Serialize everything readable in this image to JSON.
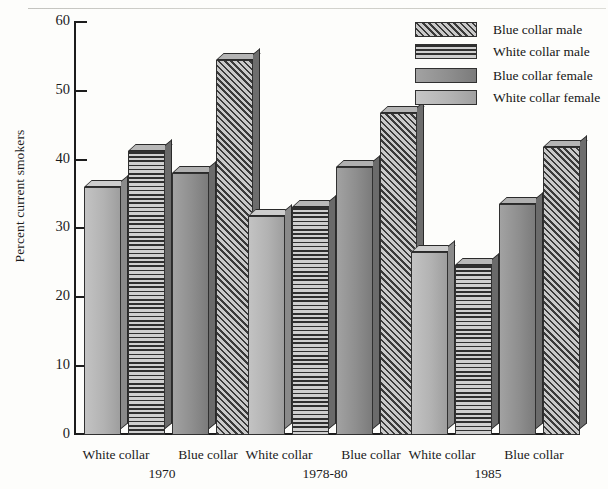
{
  "chart_data": {
    "type": "bar",
    "title": "",
    "xlabel": "",
    "ylabel": "Percent current smokers",
    "ylim": [
      0,
      60
    ],
    "ytick_labels": [
      "0",
      "10",
      "20",
      "30",
      "40",
      "50",
      "60"
    ],
    "ytick_values": [
      0,
      10,
      20,
      30,
      40,
      50,
      60
    ],
    "grid": false,
    "legend_position": "top-right",
    "groups": [
      {
        "period": "1970",
        "collars": [
          "White collar",
          "Blue collar"
        ]
      },
      {
        "period": "1978-80",
        "collars": [
          "White collar",
          "Blue collar"
        ]
      },
      {
        "period": "1985",
        "collars": [
          "White collar",
          "Blue collar"
        ]
      }
    ],
    "categories": [
      "1970",
      "1978-80",
      "1985"
    ],
    "series": [
      {
        "name": "Blue collar male",
        "pattern": "diagonal-hatch",
        "values": [
          54.3,
          46.7,
          41.8
        ]
      },
      {
        "name": "White collar male",
        "pattern": "horizontal-lines",
        "values": [
          41.2,
          33.0,
          24.7
        ]
      },
      {
        "name": "Blue collar female",
        "pattern": "solid-dark-gray",
        "values": [
          38.0,
          38.8,
          33.5
        ]
      },
      {
        "name": "White collar female",
        "pattern": "solid-light-gray",
        "values": [
          36.0,
          31.7,
          26.5
        ]
      }
    ],
    "bar_order_within_group": [
      "White collar female",
      "White collar male",
      "Blue collar female",
      "Blue collar male"
    ]
  },
  "legend": {
    "items": [
      {
        "label": "Blue collar male"
      },
      {
        "label": "White collar male"
      },
      {
        "label": "Blue collar female"
      },
      {
        "label": "White collar female"
      }
    ]
  },
  "axis": {
    "y_title": "Percent current smokers",
    "y_ticks": [
      "60",
      "50",
      "40",
      "30",
      "20",
      "10",
      "0"
    ]
  },
  "x_labels": {
    "g1_white": "White collar",
    "g1_blue": "Blue collar",
    "g1_period": "1970",
    "g2_white": "White collar",
    "g2_blue": "Blue collar",
    "g2_period": "1978-80",
    "g3_white": "White collar",
    "g3_blue": "Blue collar",
    "g3_period": "1985"
  },
  "colors": {
    "axis": "#1c1c1c",
    "background": "#fdfdfb",
    "bar_light": "#b4b4b4",
    "bar_dark": "#8e8e8e",
    "hatch_ink": "#3a3a3a"
  }
}
